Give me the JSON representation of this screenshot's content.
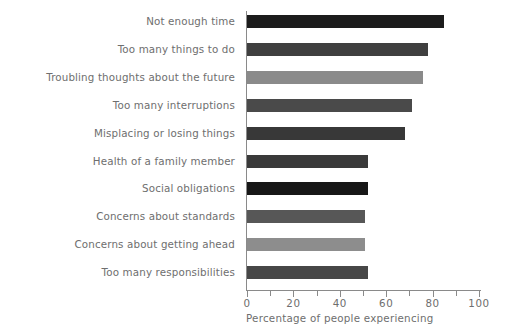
{
  "chart_data": {
    "type": "bar",
    "orientation": "horizontal",
    "title": "",
    "xlabel": "Percentage of people experiencing",
    "ylabel": "",
    "xlim": [
      0,
      100
    ],
    "xticks": [
      0,
      10,
      20,
      30,
      40,
      50,
      60,
      70,
      80,
      90,
      100
    ],
    "xtick_labels": [
      "0",
      "",
      "20",
      "",
      "40",
      "",
      "60",
      "",
      "80",
      "",
      "100"
    ],
    "grid": false,
    "legend": "none",
    "categories": [
      "Not enough time",
      "Too many things to do",
      "Troubling thoughts about the future",
      "Too many interruptions",
      "Misplacing or losing things",
      "Health of a family member",
      "Social obligations",
      "Concerns about standards",
      "Concerns about getting ahead",
      "Too many responsibilities"
    ],
    "values": [
      85,
      78,
      76,
      71,
      68,
      52,
      52,
      51,
      51,
      52
    ],
    "bar_colors": [
      "#1c1c1c",
      "#3f3f3f",
      "#8a8a8a",
      "#4a4a4a",
      "#383838",
      "#3a3a3a",
      "#171717",
      "#575757",
      "#8d8d8d",
      "#474747"
    ]
  }
}
